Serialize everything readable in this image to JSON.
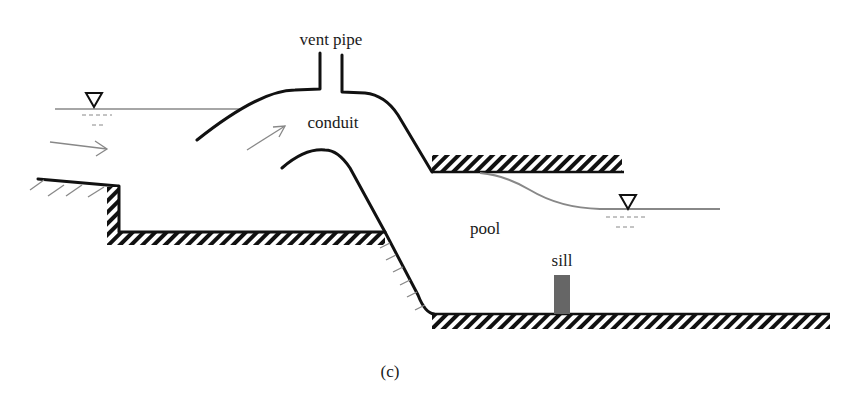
{
  "diagram": {
    "labels": {
      "vent_pipe": "vent pipe",
      "conduit": "conduit",
      "pool": "pool",
      "sill": "sill",
      "caption": "(c)"
    },
    "symbols": {
      "upstream_water_level": "water-surface-triangle",
      "downstream_water_level": "water-surface-triangle",
      "flow_arrow_1": "arrow-right",
      "flow_arrow_2": "arrow-up-right"
    },
    "colors": {
      "structure": "#111111",
      "water_line": "#888888",
      "sill": "#666666",
      "background": "#ffffff"
    }
  }
}
